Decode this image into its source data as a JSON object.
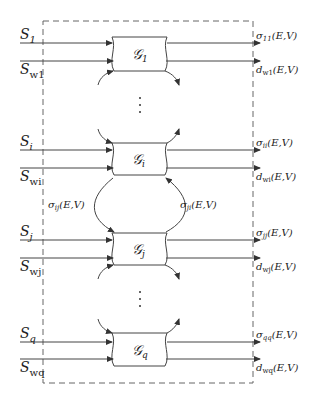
{
  "diagram": {
    "blocks": [
      {
        "id": "1",
        "name": "G",
        "sub": "1",
        "input_s": {
          "base": "S",
          "sub": "1"
        },
        "input_w": {
          "base": "S",
          "sub": "w1"
        },
        "output_sigma": {
          "base": "σ",
          "sub": "11",
          "args": "(E,V)"
        },
        "output_d": {
          "base": "d",
          "sub": "w1",
          "args": "(E,V)"
        }
      },
      {
        "id": "i",
        "name": "G",
        "sub": "i",
        "input_s": {
          "base": "S",
          "sub": "i"
        },
        "input_w": {
          "base": "S",
          "sub": "wi"
        },
        "output_sigma": {
          "base": "σ",
          "sub": "ii",
          "args": "(E,V)"
        },
        "output_d": {
          "base": "d",
          "sub": "wi",
          "args": "(E,V)"
        }
      },
      {
        "id": "j",
        "name": "G",
        "sub": "j",
        "input_s": {
          "base": "S",
          "sub": "j"
        },
        "input_w": {
          "base": "S",
          "sub": "wj"
        },
        "output_sigma": {
          "base": "σ",
          "sub": "jj",
          "args": "(E,V)"
        },
        "output_d": {
          "base": "d",
          "sub": "wj",
          "args": "(E,V)"
        }
      },
      {
        "id": "q",
        "name": "G",
        "sub": "q",
        "input_s": {
          "base": "S",
          "sub": "q"
        },
        "input_w": {
          "base": "S",
          "sub": "wq"
        },
        "output_sigma": {
          "base": "σ",
          "sub": "qq",
          "args": "(E,V)"
        },
        "output_d": {
          "base": "d",
          "sub": "wq",
          "args": "(E,V)"
        }
      }
    ],
    "coupling": {
      "left": {
        "base": "σ",
        "sub": "ij",
        "args": "(E,V)"
      },
      "right": {
        "base": "σ",
        "sub": "ji",
        "args": "(E,V)"
      }
    },
    "ellipsis": "⋮"
  }
}
